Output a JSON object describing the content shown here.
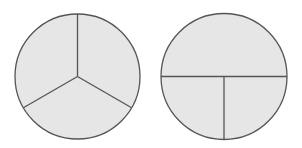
{
  "diagram": {
    "background": "#ffffff",
    "fill_color": "#e6e6e6",
    "stroke_color": "#555555",
    "circles": [
      {
        "name": "circle-thirds",
        "description": "Circle divided into three equal parts",
        "cx": 77.5,
        "cy": 76.5,
        "r": 62.5,
        "parts": 3,
        "divider_lines": [
          {
            "x1": 77.5,
            "y1": 76.5,
            "x2": 77.5,
            "y2": 14
          },
          {
            "x1": 77.5,
            "y1": 76.5,
            "x2": 131.6,
            "y2": 107.75
          },
          {
            "x1": 77.5,
            "y1": 76.5,
            "x2": 23.4,
            "y2": 107.75
          }
        ]
      },
      {
        "name": "circle-half-and-quarters",
        "description": "Circle divided into one half and two quarters",
        "cx": 224,
        "cy": 76.5,
        "r": 63,
        "parts": 3,
        "divider_lines": [
          {
            "x1": 161,
            "y1": 76.5,
            "x2": 287,
            "y2": 76.5
          },
          {
            "x1": 224,
            "y1": 76.5,
            "x2": 224,
            "y2": 139.5
          }
        ]
      }
    ]
  }
}
